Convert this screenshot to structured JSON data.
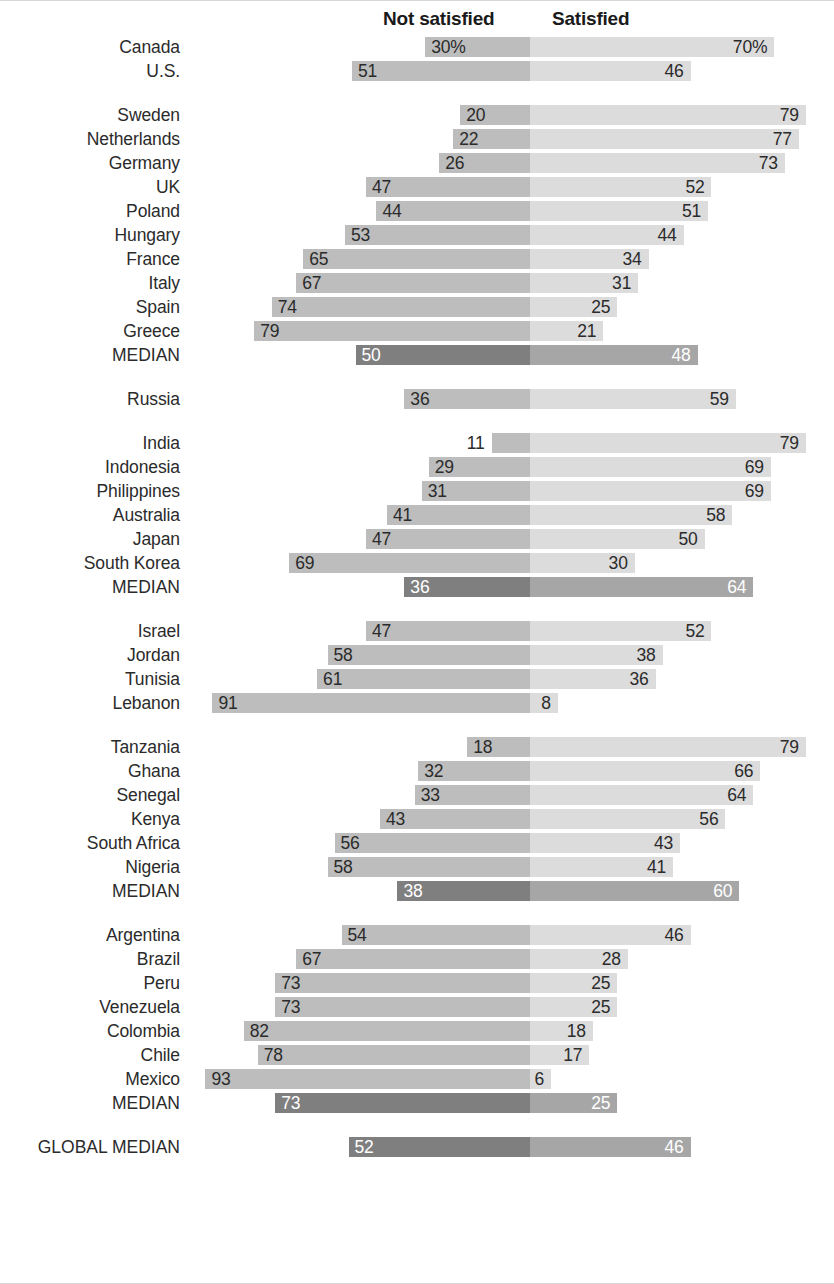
{
  "header": {
    "not_satisfied_label": "Not satisfied",
    "satisfied_label": "Satisfied"
  },
  "colors": {
    "not_satisfied_bar": "#bdbdbd",
    "satisfied_bar": "#dcdcdc",
    "median_not_satisfied_bar": "#7f7f7f",
    "median_satisfied_bar": "#a6a6a6",
    "text": "#2b2b2b",
    "median_text": "#ffffff",
    "background": "#ffffff",
    "rule": "#d8d8d8"
  },
  "chart_data": {
    "type": "bar",
    "subtype": "diverging-stacked-bar",
    "title": "",
    "xlabel": "",
    "ylabel": "",
    "axis_center_value": 0,
    "grid": false,
    "legend_position": "top",
    "series": [
      {
        "name": "Not satisfied",
        "side": "left"
      },
      {
        "name": "Satisfied",
        "side": "right"
      }
    ],
    "groups": [
      {
        "name": "North America",
        "rows": [
          {
            "label": "Canada",
            "not_satisfied": 30,
            "satisfied": 70,
            "not_satisfied_text": "30%",
            "satisfied_text": "70%",
            "median": false
          },
          {
            "label": "U.S.",
            "not_satisfied": 51,
            "satisfied": 46,
            "not_satisfied_text": "51",
            "satisfied_text": "46",
            "median": false
          }
        ]
      },
      {
        "name": "Europe",
        "rows": [
          {
            "label": "Sweden",
            "not_satisfied": 20,
            "satisfied": 79,
            "not_satisfied_text": "20",
            "satisfied_text": "79",
            "median": false
          },
          {
            "label": "Netherlands",
            "not_satisfied": 22,
            "satisfied": 77,
            "not_satisfied_text": "22",
            "satisfied_text": "77",
            "median": false
          },
          {
            "label": "Germany",
            "not_satisfied": 26,
            "satisfied": 73,
            "not_satisfied_text": "26",
            "satisfied_text": "73",
            "median": false
          },
          {
            "label": "UK",
            "not_satisfied": 47,
            "satisfied": 52,
            "not_satisfied_text": "47",
            "satisfied_text": "52",
            "median": false
          },
          {
            "label": "Poland",
            "not_satisfied": 44,
            "satisfied": 51,
            "not_satisfied_text": "44",
            "satisfied_text": "51",
            "median": false
          },
          {
            "label": "Hungary",
            "not_satisfied": 53,
            "satisfied": 44,
            "not_satisfied_text": "53",
            "satisfied_text": "44",
            "median": false
          },
          {
            "label": "France",
            "not_satisfied": 65,
            "satisfied": 34,
            "not_satisfied_text": "65",
            "satisfied_text": "34",
            "median": false
          },
          {
            "label": "Italy",
            "not_satisfied": 67,
            "satisfied": 31,
            "not_satisfied_text": "67",
            "satisfied_text": "31",
            "median": false
          },
          {
            "label": "Spain",
            "not_satisfied": 74,
            "satisfied": 25,
            "not_satisfied_text": "74",
            "satisfied_text": "25",
            "median": false
          },
          {
            "label": "Greece",
            "not_satisfied": 79,
            "satisfied": 21,
            "not_satisfied_text": "79",
            "satisfied_text": "21",
            "median": false
          },
          {
            "label": "MEDIAN",
            "not_satisfied": 50,
            "satisfied": 48,
            "not_satisfied_text": "50",
            "satisfied_text": "48",
            "median": true
          }
        ]
      },
      {
        "name": "Russia",
        "rows": [
          {
            "label": "Russia",
            "not_satisfied": 36,
            "satisfied": 59,
            "not_satisfied_text": "36",
            "satisfied_text": "59",
            "median": false
          }
        ]
      },
      {
        "name": "Asia-Pacific",
        "rows": [
          {
            "label": "India",
            "not_satisfied": 11,
            "satisfied": 79,
            "not_satisfied_text": "11",
            "satisfied_text": "79",
            "median": false
          },
          {
            "label": "Indonesia",
            "not_satisfied": 29,
            "satisfied": 69,
            "not_satisfied_text": "29",
            "satisfied_text": "69",
            "median": false
          },
          {
            "label": "Philippines",
            "not_satisfied": 31,
            "satisfied": 69,
            "not_satisfied_text": "31",
            "satisfied_text": "69",
            "median": false
          },
          {
            "label": "Australia",
            "not_satisfied": 41,
            "satisfied": 58,
            "not_satisfied_text": "41",
            "satisfied_text": "58",
            "median": false
          },
          {
            "label": "Japan",
            "not_satisfied": 47,
            "satisfied": 50,
            "not_satisfied_text": "47",
            "satisfied_text": "50",
            "median": false
          },
          {
            "label": "South Korea",
            "not_satisfied": 69,
            "satisfied": 30,
            "not_satisfied_text": "69",
            "satisfied_text": "30",
            "median": false
          },
          {
            "label": "MEDIAN",
            "not_satisfied": 36,
            "satisfied": 64,
            "not_satisfied_text": "36",
            "satisfied_text": "64",
            "median": true
          }
        ]
      },
      {
        "name": "Middle East",
        "rows": [
          {
            "label": "Israel",
            "not_satisfied": 47,
            "satisfied": 52,
            "not_satisfied_text": "47",
            "satisfied_text": "52",
            "median": false
          },
          {
            "label": "Jordan",
            "not_satisfied": 58,
            "satisfied": 38,
            "not_satisfied_text": "58",
            "satisfied_text": "38",
            "median": false
          },
          {
            "label": "Tunisia",
            "not_satisfied": 61,
            "satisfied": 36,
            "not_satisfied_text": "61",
            "satisfied_text": "36",
            "median": false
          },
          {
            "label": "Lebanon",
            "not_satisfied": 91,
            "satisfied": 8,
            "not_satisfied_text": "91",
            "satisfied_text": "8",
            "median": false
          }
        ]
      },
      {
        "name": "Africa",
        "rows": [
          {
            "label": "Tanzania",
            "not_satisfied": 18,
            "satisfied": 79,
            "not_satisfied_text": "18",
            "satisfied_text": "79",
            "median": false
          },
          {
            "label": "Ghana",
            "not_satisfied": 32,
            "satisfied": 66,
            "not_satisfied_text": "32",
            "satisfied_text": "66",
            "median": false
          },
          {
            "label": "Senegal",
            "not_satisfied": 33,
            "satisfied": 64,
            "not_satisfied_text": "33",
            "satisfied_text": "64",
            "median": false
          },
          {
            "label": "Kenya",
            "not_satisfied": 43,
            "satisfied": 56,
            "not_satisfied_text": "43",
            "satisfied_text": "56",
            "median": false
          },
          {
            "label": "South Africa",
            "not_satisfied": 56,
            "satisfied": 43,
            "not_satisfied_text": "56",
            "satisfied_text": "43",
            "median": false
          },
          {
            "label": "Nigeria",
            "not_satisfied": 58,
            "satisfied": 41,
            "not_satisfied_text": "58",
            "satisfied_text": "41",
            "median": false
          },
          {
            "label": "MEDIAN",
            "not_satisfied": 38,
            "satisfied": 60,
            "not_satisfied_text": "38",
            "satisfied_text": "60",
            "median": true
          }
        ]
      },
      {
        "name": "Latin America",
        "rows": [
          {
            "label": "Argentina",
            "not_satisfied": 54,
            "satisfied": 46,
            "not_satisfied_text": "54",
            "satisfied_text": "46",
            "median": false
          },
          {
            "label": "Brazil",
            "not_satisfied": 67,
            "satisfied": 28,
            "not_satisfied_text": "67",
            "satisfied_text": "28",
            "median": false
          },
          {
            "label": "Peru",
            "not_satisfied": 73,
            "satisfied": 25,
            "not_satisfied_text": "73",
            "satisfied_text": "25",
            "median": false
          },
          {
            "label": "Venezuela",
            "not_satisfied": 73,
            "satisfied": 25,
            "not_satisfied_text": "73",
            "satisfied_text": "25",
            "median": false
          },
          {
            "label": "Colombia",
            "not_satisfied": 82,
            "satisfied": 18,
            "not_satisfied_text": "82",
            "satisfied_text": "18",
            "median": false
          },
          {
            "label": "Chile",
            "not_satisfied": 78,
            "satisfied": 17,
            "not_satisfied_text": "78",
            "satisfied_text": "17",
            "median": false
          },
          {
            "label": "Mexico",
            "not_satisfied": 93,
            "satisfied": 6,
            "not_satisfied_text": "93",
            "satisfied_text": "6",
            "median": false
          },
          {
            "label": "MEDIAN",
            "not_satisfied": 73,
            "satisfied": 25,
            "not_satisfied_text": "73",
            "satisfied_text": "25",
            "median": true
          }
        ]
      },
      {
        "name": "Global",
        "rows": [
          {
            "label": "GLOBAL MEDIAN",
            "not_satisfied": 52,
            "satisfied": 46,
            "not_satisfied_text": "52",
            "satisfied_text": "46",
            "median": true
          }
        ]
      }
    ]
  }
}
